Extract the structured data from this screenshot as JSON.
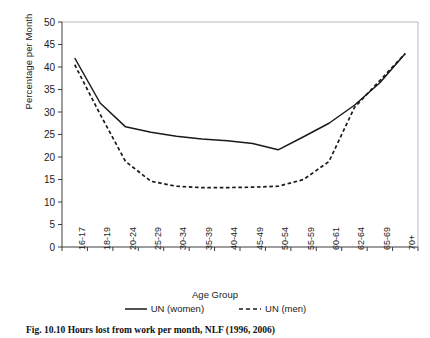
{
  "chart_data": {
    "type": "line",
    "title": "",
    "xlabel": "Age Group",
    "ylabel": "Percentage per Month",
    "categories": [
      "16-17",
      "18-19",
      "20-24",
      "25-29",
      "30-34",
      "35-39",
      "40-44",
      "45-49",
      "50-54",
      "55-59",
      "60-61",
      "62-64",
      "65-69",
      "70+"
    ],
    "ylim": [
      0,
      50
    ],
    "ytick_step": 5,
    "yticks": [
      "50",
      "45",
      "40",
      "35",
      "30",
      "25",
      "20",
      "15",
      "10",
      "5",
      "0"
    ],
    "grid": false,
    "legend_position": "below",
    "series": [
      {
        "name": "UN (women)",
        "style": "solid",
        "color": "#1a1a1a",
        "values": [
          42.0,
          32.0,
          26.7,
          25.5,
          24.6,
          24.0,
          23.6,
          23.0,
          21.6,
          24.5,
          27.5,
          31.5,
          36.5,
          43.0
        ]
      },
      {
        "name": "UN (men)",
        "style": "dashed",
        "color": "#1a1a1a",
        "values": [
          40.5,
          29.5,
          19.0,
          14.6,
          13.5,
          13.2,
          13.2,
          13.3,
          13.5,
          15.0,
          19.0,
          31.0,
          37.0,
          43.0
        ]
      }
    ]
  },
  "legend": {
    "items": [
      {
        "label": "UN (women)",
        "style": "solid"
      },
      {
        "label": "UN (men)",
        "style": "dashed"
      }
    ]
  },
  "caption": {
    "text": "Fig. 10.10   Hours lost from work per month, NLF (1996, 2006)"
  },
  "colors": {
    "line": "#1a1a1a",
    "axis": "#3c3c3c",
    "frame_light": "#b9b9b9",
    "text": "#1a1a1a",
    "background": "#ffffff"
  }
}
